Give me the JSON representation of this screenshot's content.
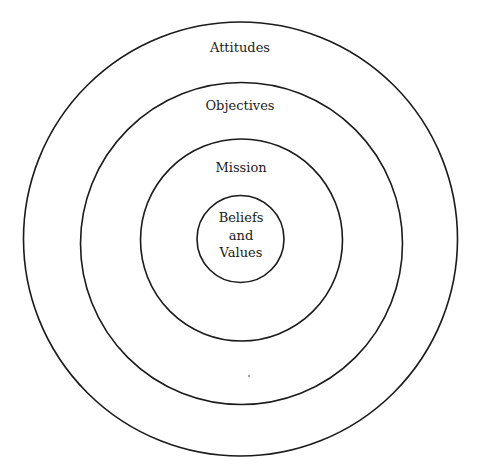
{
  "diagram": {
    "type": "concentric-circles",
    "layers": [
      {
        "id": "attitudes",
        "label": "Attitudes",
        "order": 4
      },
      {
        "id": "objectives",
        "label": "Objectives",
        "order": 3
      },
      {
        "id": "mission",
        "label": "Mission",
        "order": 2
      },
      {
        "id": "core",
        "label_lines": [
          "Beliefs",
          "and",
          "Values"
        ],
        "order": 1
      }
    ],
    "stroke_color": "#1a1a1a",
    "background": "#ffffff"
  }
}
